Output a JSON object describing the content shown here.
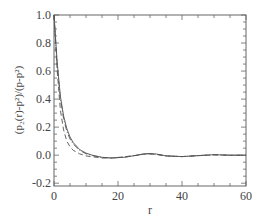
{
  "chart_data": {
    "type": "line",
    "title": "",
    "xlabel": "r",
    "ylabel": "(p₂(r)-p²)/(p-p²)",
    "xlim": [
      0,
      60
    ],
    "ylim": [
      -0.22,
      1.0
    ],
    "x_ticks": [
      0,
      20,
      40,
      60
    ],
    "x_tick_labels": [
      "0",
      "20",
      "40",
      "60"
    ],
    "y_ticks": [
      -0.2,
      0.0,
      0.2,
      0.4,
      0.6,
      0.8,
      1.0
    ],
    "y_tick_labels": [
      "-0.2",
      "0.0",
      "0.2",
      "0.4",
      "0.6",
      "0.8",
      "1.0"
    ],
    "grid": false,
    "legend": [],
    "series": [
      {
        "name": "solid",
        "style": "solid",
        "x": [
          0,
          1,
          2,
          3,
          4,
          5,
          6,
          8,
          10,
          12,
          15,
          18,
          22,
          26,
          28,
          30,
          32,
          35,
          40,
          45,
          50,
          55,
          60
        ],
        "values": [
          1.0,
          0.66,
          0.42,
          0.28,
          0.19,
          0.13,
          0.09,
          0.04,
          0.015,
          0.0,
          -0.015,
          -0.02,
          -0.015,
          0.0,
          0.01,
          0.012,
          0.008,
          -0.005,
          -0.01,
          -0.003,
          0.003,
          0.0,
          0.0
        ]
      },
      {
        "name": "dashed",
        "style": "dashed",
        "x": [
          0,
          1,
          2,
          3,
          4,
          5,
          6,
          8,
          10,
          12,
          15,
          18,
          22,
          26,
          28,
          30,
          32,
          35,
          40,
          45,
          50,
          55,
          60
        ],
        "values": [
          1.0,
          0.6,
          0.32,
          0.18,
          0.1,
          0.06,
          0.035,
          0.01,
          -0.005,
          -0.012,
          -0.02,
          -0.02,
          -0.012,
          0.0,
          0.006,
          0.008,
          0.005,
          -0.005,
          -0.01,
          -0.004,
          0.002,
          0.0,
          0.0
        ]
      },
      {
        "name": "dash-dot",
        "style": "dashdot",
        "x": [
          0,
          1,
          2,
          3,
          4,
          5,
          6,
          8,
          10,
          12,
          15,
          18,
          22,
          26,
          28,
          30,
          32,
          35,
          40,
          45,
          50,
          55,
          60
        ],
        "values": [
          1.0,
          0.64,
          0.4,
          0.26,
          0.17,
          0.115,
          0.08,
          0.035,
          0.01,
          -0.003,
          -0.017,
          -0.02,
          -0.014,
          0.0,
          0.008,
          0.01,
          0.006,
          -0.005,
          -0.01,
          -0.003,
          0.003,
          0.0,
          0.0
        ]
      }
    ]
  }
}
